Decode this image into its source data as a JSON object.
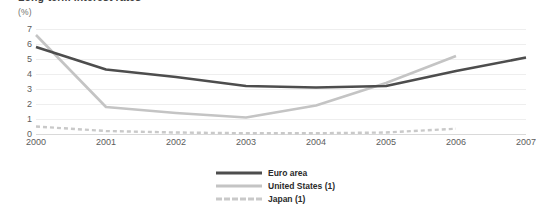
{
  "chart_data": {
    "type": "line",
    "title": "Long-term interest rates",
    "subtitle": "",
    "unit_label": "(%)",
    "xlabel": "",
    "ylabel": "",
    "x": [
      "2000",
      "2001",
      "2002",
      "2003",
      "2004",
      "2005",
      "2006",
      "2007"
    ],
    "xlim": [
      "2000",
      "2007"
    ],
    "ylim": [
      0,
      7
    ],
    "yticks": [
      7,
      6,
      5,
      4,
      3,
      2,
      1,
      0
    ],
    "grid": true,
    "legend_position": "bottom-center",
    "series": [
      {
        "name": "Euro area",
        "color": "#4d4d4d",
        "style": "solid",
        "values": [
          5.8,
          4.3,
          3.8,
          3.2,
          3.1,
          3.2,
          4.2,
          5.1
        ]
      },
      {
        "name": "United States (1)",
        "color": "#c4c4c4",
        "style": "solid",
        "values": [
          6.6,
          1.8,
          1.4,
          1.1,
          1.9,
          3.4,
          5.2,
          null
        ]
      },
      {
        "name": "Japan (1)",
        "color": "#c9c9c9",
        "style": "dashed",
        "values": [
          0.5,
          0.2,
          0.1,
          0.05,
          0.05,
          0.1,
          0.35,
          null
        ]
      }
    ]
  },
  "legend": {
    "items": [
      {
        "label": "Euro area"
      },
      {
        "label": "United States (1)"
      },
      {
        "label": "Japan (1)"
      }
    ]
  },
  "colors": {
    "euro_area": "#4d4d4d",
    "united_states": "#c4c4c4",
    "japan": "#c9c9c9",
    "gridline": "#eeeeee",
    "axis": "#d9d9d9",
    "text": "#5c5c5c",
    "background": "#ffffff"
  }
}
